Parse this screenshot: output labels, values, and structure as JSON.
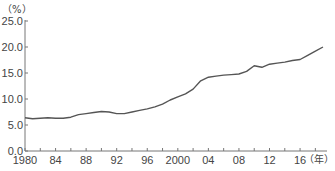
{
  "chart_data": {
    "type": "line",
    "title": "",
    "xlabel": "年",
    "ylabel": "%",
    "y_unit_label": "（%）",
    "x_unit_label": "（年）",
    "ylim": [
      0,
      25
    ],
    "xlim": [
      1980,
      2019
    ],
    "grid": false,
    "legend": null,
    "y_ticks": [
      {
        "value": 0,
        "label": "0.0"
      },
      {
        "value": 5,
        "label": "5.0"
      },
      {
        "value": 10,
        "label": "10.0"
      },
      {
        "value": 15,
        "label": "15.0"
      },
      {
        "value": 20,
        "label": "20.0"
      },
      {
        "value": 25,
        "label": "25.0"
      }
    ],
    "x_ticks_every_years": 2,
    "x_tick_labels": [
      {
        "year": 1980,
        "label": "1980"
      },
      {
        "year": 1984,
        "label": "84"
      },
      {
        "year": 1988,
        "label": "88"
      },
      {
        "year": 1992,
        "label": "92"
      },
      {
        "year": 1996,
        "label": "96"
      },
      {
        "year": 2000,
        "label": "2000"
      },
      {
        "year": 2004,
        "label": "04"
      },
      {
        "year": 2008,
        "label": "08"
      },
      {
        "year": 2012,
        "label": "12"
      },
      {
        "year": 2016,
        "label": "16"
      }
    ],
    "series": [
      {
        "name": "",
        "color": "#555555",
        "x": [
          1980,
          1981,
          1982,
          1983,
          1984,
          1985,
          1986,
          1987,
          1988,
          1989,
          1990,
          1991,
          1992,
          1993,
          1994,
          1995,
          1996,
          1997,
          1998,
          1999,
          2000,
          2001,
          2002,
          2003,
          2004,
          2005,
          2006,
          2007,
          2008,
          2009,
          2010,
          2011,
          2012,
          2013,
          2014,
          2015,
          2016,
          2017,
          2018,
          2019
        ],
        "values": [
          6.4,
          6.2,
          6.3,
          6.4,
          6.3,
          6.3,
          6.5,
          7.0,
          7.2,
          7.4,
          7.6,
          7.5,
          7.2,
          7.2,
          7.5,
          7.8,
          8.1,
          8.5,
          9.0,
          9.8,
          10.4,
          11.0,
          11.9,
          13.5,
          14.2,
          14.4,
          14.6,
          14.7,
          14.8,
          15.3,
          16.4,
          16.1,
          16.7,
          16.9,
          17.1,
          17.4,
          17.6,
          18.4,
          19.2,
          20.0
        ]
      }
    ]
  }
}
